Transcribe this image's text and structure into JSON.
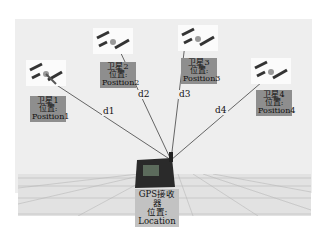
{
  "diagram": {
    "type": "gps-positioning",
    "satellites": [
      {
        "name": "卫星1",
        "pos_label": "位置:",
        "position": "Position1",
        "distance": "d1"
      },
      {
        "name": "卫星2",
        "pos_label": "位置:",
        "position": "Position2",
        "distance": "d2"
      },
      {
        "name": "卫星3",
        "pos_label": "位置:",
        "position": "Position3",
        "distance": "d3"
      },
      {
        "name": "卫星4",
        "pos_label": "位置:",
        "position": "Position4",
        "distance": "d4"
      }
    ],
    "receiver": {
      "name": "GPS接收器",
      "pos_label": "位置:",
      "location": "Location"
    },
    "colors": {
      "panel": "#eeeeee",
      "satellite_label_bg": "#8e8e8e",
      "receiver_label_bg": "#c2c2c2",
      "line": "#444444"
    }
  }
}
